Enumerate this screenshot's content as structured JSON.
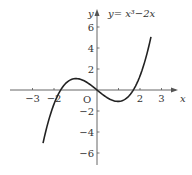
{
  "chart_data": {
    "type": "line",
    "equation_label": "y= x³−2x",
    "xlabel": "x",
    "ylabel": "y",
    "origin_label": "O",
    "xlim": [
      -3.5,
      3.8
    ],
    "ylim": [
      -6.5,
      7.5
    ],
    "x_ticks": [
      -3,
      -2,
      1,
      2,
      3
    ],
    "x_tick_labels": [
      "−3",
      "−2",
      "2",
      "3"
    ],
    "x_tick_labeled": [
      -3,
      -2,
      2,
      3
    ],
    "y_ticks": [
      -6,
      -4,
      -2,
      2,
      4,
      6
    ],
    "y_tick_labels": [
      "−6",
      "−4",
      "−2",
      "2",
      "4",
      "6"
    ],
    "grid": false,
    "series": [
      {
        "name": "y = x^3 - 2x",
        "x": [
          -2.1,
          -1.5,
          -1.0,
          -0.816,
          -0.5,
          0,
          0.5,
          0.816,
          1.0,
          1.5,
          2.1
        ],
        "y": [
          -5.06,
          -0.375,
          1.0,
          1.089,
          0.875,
          0,
          -0.875,
          -1.089,
          -1.0,
          0.375,
          5.06
        ]
      }
    ],
    "annotations": [
      "local max ≈ (−0.82, 1.09)",
      "local min ≈ (0.82, −1.09)"
    ]
  },
  "colors": {
    "axis": "#555555",
    "curve": "#222222",
    "text": "#333333"
  }
}
